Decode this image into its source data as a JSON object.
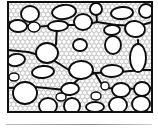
{
  "figure": {
    "type": "microstructure-schematic",
    "title": "",
    "caption": "",
    "frame": {
      "x": 8,
      "y": 2,
      "width": 144,
      "height": 110,
      "stroke_color": "#101010",
      "stroke_width": 2,
      "fill_color": "#ffffff"
    },
    "colors": {
      "outline": "#0d0d0d",
      "pore_fill": "#ffffff",
      "matrix_circle_stroke": "#b8b8b8",
      "matrix_background": "#fdfdfd",
      "channel_line": "#0d0d0d",
      "bottom_rule": "#8d8d8d",
      "page_background": "#ffffff"
    },
    "matrix": {
      "label": "packed-circle matrix",
      "circle_diameter": 4.6,
      "row_spacing": 3.9,
      "stroke_width": 0.55,
      "rows": 28,
      "columns": 33
    },
    "channels": {
      "label": "interconnecting channel network",
      "stroke_width": 2.0,
      "segments": [
        [
          8,
          22,
          33,
          27
        ],
        [
          33,
          27,
          62,
          25
        ],
        [
          62,
          25,
          84,
          25
        ],
        [
          84,
          25,
          97,
          22
        ],
        [
          97,
          22,
          116,
          25
        ],
        [
          116,
          25,
          139,
          26
        ],
        [
          139,
          26,
          152,
          22
        ],
        [
          97,
          22,
          96,
          8
        ],
        [
          57,
          27,
          56,
          44
        ],
        [
          56,
          44,
          50,
          58
        ],
        [
          8,
          50,
          28,
          52
        ],
        [
          28,
          52,
          50,
          58
        ],
        [
          50,
          58,
          72,
          72
        ],
        [
          72,
          72,
          95,
          73
        ],
        [
          95,
          73,
          120,
          72
        ],
        [
          120,
          72,
          141,
          70
        ],
        [
          141,
          70,
          152,
          70
        ],
        [
          8,
          88,
          35,
          87
        ],
        [
          35,
          87,
          66,
          90
        ],
        [
          66,
          90,
          80,
          78
        ],
        [
          80,
          78,
          95,
          73
        ],
        [
          95,
          73,
          104,
          88
        ],
        [
          104,
          88,
          125,
          89
        ],
        [
          125,
          89,
          152,
          88
        ],
        [
          138,
          40,
          139,
          60
        ],
        [
          139,
          60,
          139,
          70
        ]
      ]
    },
    "pores": [
      {
        "id": "p01",
        "cx": 30,
        "cy": 14,
        "rx": 9,
        "ry": 8,
        "rot": 0,
        "size": "large"
      },
      {
        "id": "p02",
        "cx": 64,
        "cy": 12,
        "rx": 12,
        "ry": 7,
        "rot": -6,
        "size": "large"
      },
      {
        "id": "p03",
        "cx": 96,
        "cy": 9,
        "rx": 6,
        "ry": 6,
        "rot": 0,
        "size": "medium"
      },
      {
        "id": "p04",
        "cx": 122,
        "cy": 13,
        "rx": 11,
        "ry": 6,
        "rot": -4,
        "size": "large"
      },
      {
        "id": "p05",
        "cx": 146,
        "cy": 11,
        "rx": 7,
        "ry": 7,
        "rot": 0,
        "size": "medium"
      },
      {
        "id": "p06",
        "cx": 18,
        "cy": 26,
        "rx": 9,
        "ry": 6,
        "rot": 4,
        "size": "medium"
      },
      {
        "id": "p07",
        "cx": 34,
        "cy": 27,
        "rx": 6,
        "ry": 5,
        "rot": 0,
        "size": "small"
      },
      {
        "id": "p08",
        "cx": 58,
        "cy": 26,
        "rx": 10,
        "ry": 5,
        "rot": -2,
        "size": "medium"
      },
      {
        "id": "p09",
        "cx": 83,
        "cy": 22,
        "rx": 9,
        "ry": 8,
        "rot": 0,
        "size": "large"
      },
      {
        "id": "p10",
        "cx": 112,
        "cy": 30,
        "rx": 8,
        "ry": 5,
        "rot": -3,
        "size": "medium"
      },
      {
        "id": "p11",
        "cx": 135,
        "cy": 29,
        "rx": 10,
        "ry": 8,
        "rot": 8,
        "size": "large"
      },
      {
        "id": "p12",
        "cx": 80,
        "cy": 45,
        "rx": 7,
        "ry": 6,
        "rot": 0,
        "size": "medium"
      },
      {
        "id": "p13",
        "cx": 113,
        "cy": 45,
        "rx": 8,
        "ry": 9,
        "rot": 0,
        "size": "large"
      },
      {
        "id": "p14",
        "cx": 47,
        "cy": 53,
        "rx": 11,
        "ry": 10,
        "rot": 0,
        "size": "x-large"
      },
      {
        "id": "p15",
        "cx": 16,
        "cy": 60,
        "rx": 9,
        "ry": 6,
        "rot": -8,
        "size": "medium"
      },
      {
        "id": "p16",
        "cx": 138,
        "cy": 58,
        "rx": 8,
        "ry": 14,
        "rot": 0,
        "size": "x-large"
      },
      {
        "id": "p17",
        "cx": 43,
        "cy": 72,
        "rx": 11,
        "ry": 6,
        "rot": -5,
        "size": "large"
      },
      {
        "id": "p18",
        "cx": 81,
        "cy": 70,
        "rx": 12,
        "ry": 9,
        "rot": -3,
        "size": "x-large"
      },
      {
        "id": "p19",
        "cx": 112,
        "cy": 71,
        "rx": 11,
        "ry": 6,
        "rot": -2,
        "size": "large"
      },
      {
        "id": "p20",
        "cx": 25,
        "cy": 93,
        "rx": 12,
        "ry": 11,
        "rot": 0,
        "size": "x-large"
      },
      {
        "id": "p21",
        "cx": 70,
        "cy": 89,
        "rx": 9,
        "ry": 6,
        "rot": -6,
        "size": "medium"
      },
      {
        "id": "p22",
        "cx": 105,
        "cy": 86,
        "rx": 4,
        "ry": 4,
        "rot": 0,
        "size": "small"
      },
      {
        "id": "p23",
        "cx": 121,
        "cy": 90,
        "rx": 9,
        "ry": 7,
        "rot": 0,
        "size": "medium"
      },
      {
        "id": "p24",
        "cx": 142,
        "cy": 89,
        "rx": 8,
        "ry": 7,
        "rot": 0,
        "size": "medium"
      },
      {
        "id": "p25",
        "cx": 48,
        "cy": 106,
        "rx": 9,
        "ry": 8,
        "rot": 0,
        "size": "large"
      },
      {
        "id": "p26",
        "cx": 72,
        "cy": 106,
        "rx": 8,
        "ry": 8,
        "rot": 0,
        "size": "large"
      },
      {
        "id": "p27",
        "cx": 95,
        "cy": 107,
        "rx": 9,
        "ry": 5,
        "rot": 0,
        "size": "medium"
      },
      {
        "id": "p28",
        "cx": 118,
        "cy": 105,
        "rx": 9,
        "ry": 8,
        "rot": 0,
        "size": "large"
      },
      {
        "id": "p29",
        "cx": 141,
        "cy": 104,
        "rx": 9,
        "ry": 8,
        "rot": 0,
        "size": "large"
      },
      {
        "id": "p30",
        "cx": 96,
        "cy": 96,
        "rx": 5,
        "ry": 4,
        "rot": 0,
        "size": "small"
      },
      {
        "id": "p31",
        "cx": 61,
        "cy": 97,
        "rx": 5,
        "ry": 4,
        "rot": 0,
        "size": "small"
      },
      {
        "id": "p32",
        "cx": 14,
        "cy": 77,
        "rx": 5,
        "ry": 4,
        "rot": 0,
        "size": "small"
      }
    ]
  },
  "bottom_rule": {
    "label": "adjacent figure top edge",
    "visible": true
  }
}
